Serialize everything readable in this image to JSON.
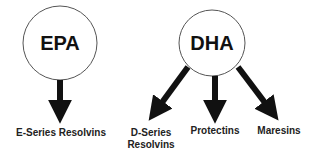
{
  "diagram": {
    "sources": [
      {
        "id": "epa",
        "label": "EPA"
      },
      {
        "id": "dha",
        "label": "DHA"
      }
    ],
    "products": [
      {
        "id": "e-series-resolvins",
        "from": "epa",
        "label": "E-Series Resolvins"
      },
      {
        "id": "d-series-resolvins",
        "from": "dha",
        "label_line1": "D-Series",
        "label_line2": "Resolvins"
      },
      {
        "id": "protectins",
        "from": "dha",
        "label": "Protectins"
      },
      {
        "id": "maresins",
        "from": "dha",
        "label": "Maresins"
      }
    ],
    "colors": {
      "stroke": "#555555",
      "arrow": "#111111",
      "text": "#222222",
      "background": "#ffffff"
    }
  }
}
